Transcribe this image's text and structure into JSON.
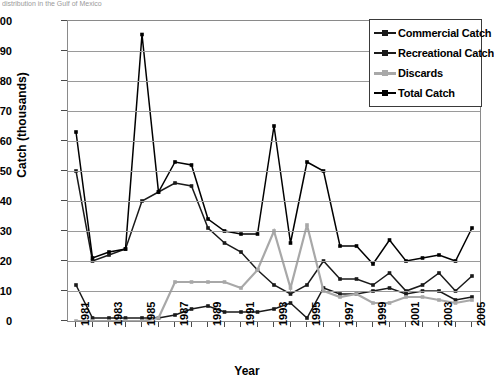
{
  "clipped_caption": "distribution in the Gulf of Mexico",
  "axes": {
    "y_title": "Catch (thousands)",
    "x_title": "Year",
    "y_ticks": [
      0,
      10,
      20,
      30,
      40,
      50,
      60,
      70,
      80,
      90,
      100
    ],
    "x_ticks_shown": [
      "1981",
      "1983",
      "1985",
      "1987",
      "1989",
      "1991",
      "1993",
      "1995",
      "1997",
      "1999",
      "2001",
      "2003",
      "2005"
    ]
  },
  "legend": {
    "position": "top-right-inside",
    "items": [
      {
        "label": "Commercial Catch",
        "color": "#1a1a1a"
      },
      {
        "label": "Recreational Catch",
        "color": "#1a1a1a"
      },
      {
        "label": "Discards",
        "color": "#a8a8a8"
      },
      {
        "label": "Total Catch",
        "color": "#000000"
      }
    ]
  },
  "chart_data": {
    "type": "line",
    "title": "",
    "xlabel": "Year",
    "ylabel": "Catch (thousands)",
    "xlim": [
      1981,
      2005
    ],
    "ylim": [
      0,
      100
    ],
    "grid": true,
    "legend_position": "upper right",
    "x": [
      1981,
      1982,
      1983,
      1984,
      1985,
      1986,
      1987,
      1988,
      1989,
      1990,
      1991,
      1992,
      1993,
      1994,
      1995,
      1996,
      1997,
      1998,
      1999,
      2000,
      2001,
      2002,
      2003,
      2004,
      2005
    ],
    "series": [
      {
        "name": "Commercial Catch",
        "color": "#1a1a1a",
        "marker": "square",
        "values": [
          50,
          20,
          22,
          24,
          40,
          43,
          46,
          45,
          31,
          26,
          23,
          17,
          12,
          9,
          12,
          20,
          14,
          14,
          12,
          16,
          10,
          12,
          16,
          10,
          15
        ]
      },
      {
        "name": "Recreational Catch",
        "color": "#1a1a1a",
        "marker": "square",
        "values": [
          12,
          1,
          1,
          1,
          1,
          1,
          2,
          4,
          5,
          3,
          3,
          3,
          4,
          6,
          1,
          11,
          9,
          9,
          10,
          11,
          9,
          10,
          10,
          7,
          8
        ]
      },
      {
        "name": "Discards",
        "color": "#a8a8a8",
        "marker": "square",
        "values": [
          0,
          0,
          0,
          0,
          0,
          1,
          13,
          13,
          13,
          13,
          11,
          17,
          30,
          11,
          32,
          10,
          8,
          9,
          6,
          6,
          8,
          8,
          7,
          6,
          7
        ]
      },
      {
        "name": "Total Catch",
        "color": "#000000",
        "marker": "square",
        "values": [
          63,
          21,
          23,
          24,
          95.5,
          43,
          53,
          52,
          34,
          30,
          29,
          29,
          65,
          26,
          53,
          50,
          25,
          25,
          19,
          27,
          20,
          21,
          22,
          20,
          31
        ]
      }
    ]
  }
}
